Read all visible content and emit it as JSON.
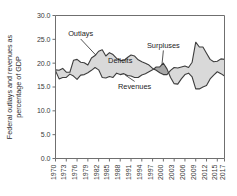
{
  "chart_data": {
    "type": "area",
    "title": "",
    "xlabel": "",
    "ylabel": "Federal outlays and revenues as percentage of GDP",
    "ylim": [
      0.0,
      30.0
    ],
    "yticks": [
      "0.0",
      "5.0",
      "10.0",
      "15.0",
      "20.0",
      "25.0",
      "30.0"
    ],
    "ytick_values": [
      0.0,
      5.0,
      10.0,
      15.0,
      20.0,
      25.0,
      30.0
    ],
    "xlim": [
      1970,
      2017
    ],
    "xticks": [
      "1970",
      "1973",
      "1976",
      "1979",
      "1982",
      "1985",
      "1988",
      "1991",
      "1994",
      "1997",
      "2000",
      "2003",
      "2006",
      "2009",
      "2012",
      "2015",
      "2017"
    ],
    "xtick_values": [
      1970,
      1973,
      1976,
      1979,
      1982,
      1985,
      1988,
      1991,
      1994,
      1997,
      2000,
      2003,
      2006,
      2009,
      2012,
      2015,
      2017
    ],
    "grid": false,
    "legend_position": "none",
    "x": [
      1970,
      1971,
      1972,
      1973,
      1974,
      1975,
      1976,
      1977,
      1978,
      1979,
      1980,
      1981,
      1982,
      1983,
      1984,
      1985,
      1986,
      1987,
      1988,
      1989,
      1990,
      1991,
      1992,
      1993,
      1994,
      1995,
      1996,
      1997,
      1998,
      1999,
      2000,
      2001,
      2002,
      2003,
      2004,
      2005,
      2006,
      2007,
      2008,
      2009,
      2010,
      2011,
      2012,
      2013,
      2014,
      2015,
      2016,
      2017
    ],
    "series": [
      {
        "name": "Outlays",
        "values": [
          18.6,
          18.5,
          18.9,
          18.1,
          18.1,
          20.6,
          20.8,
          20.2,
          20.1,
          19.6,
          21.1,
          21.6,
          22.5,
          22.8,
          21.5,
          22.2,
          21.8,
          21.0,
          20.6,
          20.5,
          21.2,
          21.7,
          21.5,
          20.7,
          20.3,
          20.0,
          19.6,
          18.9,
          18.5,
          18.0,
          17.6,
          17.6,
          18.5,
          19.1,
          19.0,
          19.2,
          19.4,
          19.1,
          20.2,
          24.4,
          23.4,
          23.4,
          22.1,
          20.8,
          20.3,
          20.4,
          20.9,
          20.8
        ]
      },
      {
        "name": "Revenues",
        "values": [
          18.4,
          16.7,
          17.0,
          17.0,
          17.7,
          17.3,
          16.6,
          17.5,
          17.6,
          18.0,
          18.5,
          19.1,
          18.6,
          17.0,
          16.9,
          17.2,
          17.0,
          17.9,
          17.6,
          17.8,
          17.4,
          17.3,
          17.0,
          17.0,
          17.5,
          17.8,
          18.2,
          18.6,
          19.2,
          19.2,
          20.0,
          18.8,
          17.0,
          15.7,
          15.6,
          16.7,
          17.6,
          17.9,
          17.1,
          14.6,
          14.6,
          15.0,
          15.3,
          16.7,
          17.5,
          18.2,
          17.8,
          17.3
        ]
      }
    ],
    "annotations": [
      {
        "label": "Outlays",
        "x": 1977,
        "y": 25.6
      },
      {
        "label": "Deficits",
        "x": 1988,
        "y": 20.0
      },
      {
        "label": "Surpluses",
        "x": 2000,
        "y": 23.2
      },
      {
        "label": "Revenues",
        "x": 1992,
        "y": 14.6
      }
    ]
  },
  "colors": {
    "deficit_fill": "#d9d9d9",
    "surplus_fill": "#a8a8a8",
    "line": "#3d3d3d",
    "axis": "#6f6f6f",
    "text": "#2b2b2b",
    "background": "#ffffff"
  }
}
